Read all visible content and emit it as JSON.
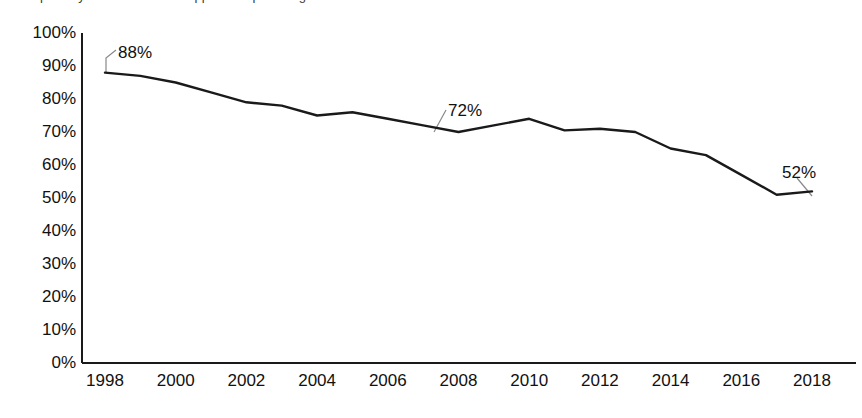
{
  "caption_clipped": "partially visible text line cropped at top of image",
  "chart_data": {
    "type": "line",
    "title": "",
    "subtitle": "",
    "xlabel": "",
    "ylabel": "",
    "ylim": [
      0,
      100
    ],
    "xlim": [
      1998,
      2018
    ],
    "grid": false,
    "legend": "none",
    "y_tick_labels": [
      "100%",
      "90%",
      "80%",
      "70%",
      "60%",
      "50%",
      "40%",
      "30%",
      "20%",
      "10%",
      "0%"
    ],
    "y_tick_values": [
      100,
      90,
      80,
      70,
      60,
      50,
      40,
      30,
      20,
      10,
      0
    ],
    "x_tick_labels": [
      "1998",
      "2000",
      "2002",
      "2004",
      "2006",
      "2008",
      "2010",
      "2012",
      "2014",
      "2016",
      "2018"
    ],
    "x_tick_values": [
      1998,
      2000,
      2002,
      2004,
      2006,
      2008,
      2010,
      2012,
      2014,
      2016,
      2018
    ],
    "x": [
      1998,
      1999,
      2000,
      2001,
      2002,
      2003,
      2004,
      2005,
      2006,
      2007,
      2008,
      2009,
      2010,
      2011,
      2012,
      2013,
      2014,
      2015,
      2016,
      2017,
      2018
    ],
    "series": [
      {
        "name": "percent",
        "color": "#1a1a1a",
        "values": [
          88,
          87,
          85,
          82,
          79,
          78,
          75,
          76,
          74,
          72,
          70,
          72,
          74,
          70.5,
          71,
          70,
          65,
          63,
          57,
          51,
          52
        ]
      }
    ],
    "annotations": [
      {
        "label": "88%",
        "x": 1998,
        "y": 88,
        "label_x_px": 118,
        "label_y_px": 44,
        "leader_from_px": [
          106,
          73
        ],
        "leader_mid_px": [
          106,
          58
        ],
        "leader_to_px": [
          116,
          50
        ]
      },
      {
        "label": "72%",
        "x": 2007,
        "y": 72,
        "label_x_px": 448,
        "label_y_px": 102,
        "leader_from_px": [
          434,
          132
        ],
        "leader_mid_px": [
          434,
          132
        ],
        "leader_to_px": [
          446,
          110
        ]
      },
      {
        "label": "52%",
        "x": 2018,
        "y": 52,
        "label_x_px": 782,
        "label_y_px": 164,
        "leader_from_px": [
          812,
          196
        ],
        "leader_mid_px": [
          812,
          196
        ],
        "leader_to_px": [
          797,
          178
        ]
      }
    ],
    "axis_color": "#1a1a1a",
    "line_color": "#1a1a1a",
    "line_width_px": 2.4,
    "leader_color": "#888888"
  }
}
